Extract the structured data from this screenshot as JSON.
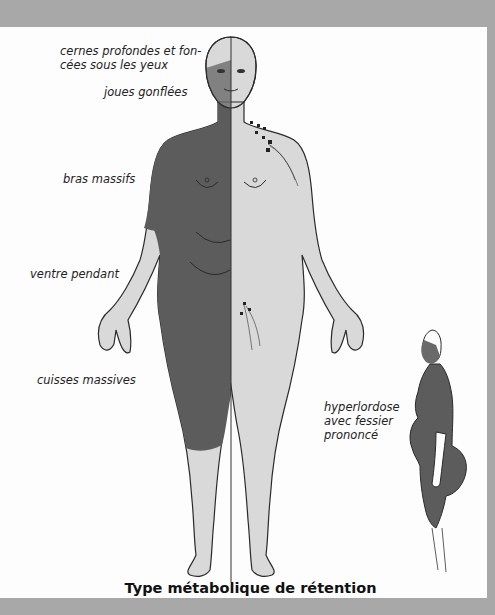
{
  "figure": {
    "title": "Type métabolique de rétention",
    "colors": {
      "frame": "#a8a8a8",
      "background": "#fdfdfd",
      "affected_zone": "#5c5c5c",
      "body_light": "#d9d9d9",
      "outline": "#2a2a2a"
    },
    "front_view_labels": [
      {
        "id": "eyes",
        "lines": [
          "cernes profondes et fon-",
          "cées sous les yeux"
        ]
      },
      {
        "id": "cheeks",
        "text": "joues gonflées"
      },
      {
        "id": "arms",
        "text": "bras massifs"
      },
      {
        "id": "belly",
        "text": "ventre pendant"
      },
      {
        "id": "thighs",
        "text": "cuisses massives"
      }
    ],
    "side_view_label": {
      "lines": [
        "hyperlordose",
        "avec fessier",
        "prononcé"
      ]
    }
  }
}
